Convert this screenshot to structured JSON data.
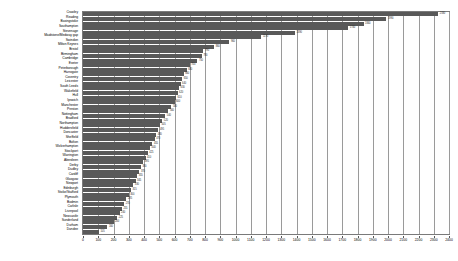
{
  "chart_data": {
    "type": "bar",
    "orientation": "horizontal",
    "title": "",
    "subtitle": "",
    "xlabel": "",
    "ylabel": "",
    "xlim": [
      0,
      2400
    ],
    "xtick_step": 100,
    "grid": true,
    "grid_axis": "x",
    "legend": null,
    "bar_color": "#595959",
    "show_value_labels": true,
    "xticks": [
      0,
      100,
      200,
      300,
      400,
      500,
      600,
      700,
      800,
      900,
      1000,
      1100,
      1200,
      1300,
      1400,
      1500,
      1600,
      1700,
      1800,
      1900,
      2000,
      2100,
      2200,
      2300,
      2400
    ],
    "categories": [
      "Crawley",
      "Reading",
      "Basingstoke",
      "Southampton",
      "Stevenage",
      "Maidstone/Medway gap",
      "Swindon",
      "Milton Keynes",
      "Bristol",
      "Birmingham",
      "Cambridge",
      "Exeter",
      "Peterborough",
      "Harrogate",
      "Coventry",
      "Leicester",
      "South Leeds",
      "Wakefield",
      "Hull",
      "Ipswich",
      "Manchester",
      "Preston",
      "Nottingham",
      "Bradford",
      "Northampton",
      "Huddersfield",
      "Doncaster",
      "Sheffield",
      "Bolton",
      "Wolverhampton",
      "Stockport",
      "Warrington",
      "Aberdeen",
      "Derby",
      "Dudley",
      "Cardiff",
      "Glasgow",
      "Newport",
      "Edinburgh",
      "Stoke/Stafford",
      "Plymouth",
      "Bodmin",
      "Carlisle",
      "Liverpool",
      "Newcastle",
      "Sunderland",
      "Durham",
      "Dundee"
    ],
    "values": [
      2330,
      1990,
      1840,
      1740,
      1390,
      1170,
      960,
      860,
      790,
      780,
      750,
      700,
      680,
      660,
      650,
      640,
      630,
      620,
      610,
      600,
      580,
      560,
      540,
      520,
      505,
      495,
      480,
      470,
      455,
      440,
      425,
      410,
      395,
      380,
      370,
      355,
      345,
      330,
      315,
      300,
      285,
      270,
      255,
      240,
      225,
      200,
      160,
      105
    ]
  }
}
